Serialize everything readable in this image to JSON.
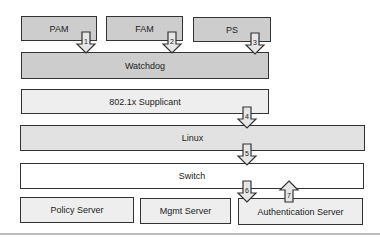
{
  "diagram": {
    "top_row": [
      {
        "label": "PAM"
      },
      {
        "label": "FAM"
      },
      {
        "label": "PS"
      }
    ],
    "layers": [
      {
        "label": "Watchdog"
      },
      {
        "label": "802.1x Supplicant"
      },
      {
        "label": "Linux"
      },
      {
        "label": "Switch"
      }
    ],
    "servers": [
      {
        "label": "Policy Server"
      },
      {
        "label": "Mgmt Server"
      },
      {
        "label": "Authentication Server"
      }
    ],
    "arrows": [
      {
        "number": "1",
        "direction": "down",
        "from": "PAM",
        "to": "Watchdog"
      },
      {
        "number": "2",
        "direction": "down",
        "from": "FAM",
        "to": "Watchdog"
      },
      {
        "number": "3",
        "direction": "down",
        "from": "PS",
        "to": "Watchdog"
      },
      {
        "number": "4",
        "direction": "down",
        "from": "802.1x Supplicant",
        "to": "Linux"
      },
      {
        "number": "5",
        "direction": "down",
        "from": "Linux",
        "to": "Switch"
      },
      {
        "number": "6",
        "direction": "down",
        "from": "Switch",
        "to": "Authentication Server"
      },
      {
        "number": "7",
        "direction": "up",
        "from": "Authentication Server",
        "to": "Switch"
      }
    ],
    "colors": {
      "dark_box": "#cdcdcd",
      "mid_box": "#e2e2e2",
      "light_box": "#eeeeee",
      "white_box": "#ffffff",
      "border": "#333333",
      "arrow_fill": "#e6e6e6"
    }
  }
}
